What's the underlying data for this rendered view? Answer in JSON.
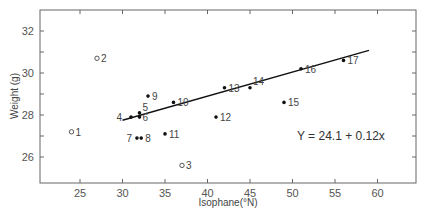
{
  "chart_data": {
    "type": "scatter",
    "title": "",
    "xlabel": "Isophane(°N)",
    "ylabel": "Weight (g)",
    "xlim": [
      21,
      64
    ],
    "ylim": [
      25,
      33
    ],
    "xticks": [
      25,
      30,
      35,
      40,
      45,
      50,
      55,
      60
    ],
    "yticks": [
      26,
      28,
      30,
      32
    ],
    "yminor_ticks": [
      27,
      29,
      31
    ],
    "grid": false,
    "legend": null,
    "points": [
      {
        "label": "1",
        "x": 24,
        "y": 27.2,
        "marker": "open"
      },
      {
        "label": "2",
        "x": 27,
        "y": 30.7,
        "marker": "open"
      },
      {
        "label": "3",
        "x": 37,
        "y": 25.6,
        "marker": "open"
      },
      {
        "label": "4",
        "x": 31,
        "y": 27.9,
        "marker": "filled"
      },
      {
        "label": "5",
        "x": 32,
        "y": 28.1,
        "marker": "filled"
      },
      {
        "label": "6",
        "x": 32,
        "y": 27.9,
        "marker": "filled"
      },
      {
        "label": "7",
        "x": 31.7,
        "y": 26.9,
        "marker": "filled"
      },
      {
        "label": "8",
        "x": 32.2,
        "y": 26.9,
        "marker": "filled"
      },
      {
        "label": "9",
        "x": 33,
        "y": 28.9,
        "marker": "filled"
      },
      {
        "label": "10",
        "x": 36,
        "y": 28.6,
        "marker": "filled"
      },
      {
        "label": "11",
        "x": 35,
        "y": 27.1,
        "marker": "filled"
      },
      {
        "label": "12",
        "x": 41,
        "y": 27.9,
        "marker": "filled"
      },
      {
        "label": "13",
        "x": 42,
        "y": 29.3,
        "marker": "filled"
      },
      {
        "label": "14",
        "x": 45,
        "y": 29.3,
        "marker": "filled"
      },
      {
        "label": "15",
        "x": 49,
        "y": 28.6,
        "marker": "filled"
      },
      {
        "label": "16",
        "x": 51,
        "y": 30.2,
        "marker": "filled"
      },
      {
        "label": "17",
        "x": 56,
        "y": 30.6,
        "marker": "filled"
      }
    ],
    "regression": {
      "intercept": 24.1,
      "slope": 0.12,
      "x_range": [
        30,
        59
      ],
      "equation_text": "Y = 24.1 + 0.12x"
    }
  }
}
